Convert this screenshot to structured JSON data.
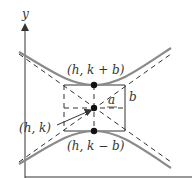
{
  "diagram": {
    "axes": {
      "x_label": "x",
      "y_label": "y"
    },
    "labels": {
      "top_vertex": "(h, k + b)",
      "center": "(h, k)",
      "bottom_vertex": "(h, k − b)",
      "a": "a",
      "b": "b"
    },
    "colors": {
      "curve": "#8a8a8a",
      "lines": "#333333",
      "points": "#111111"
    }
  }
}
